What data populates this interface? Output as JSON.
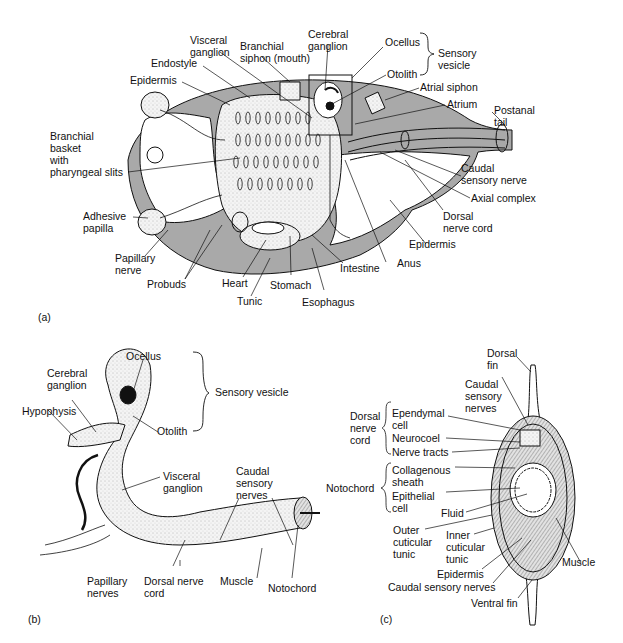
{
  "figure": {
    "panels": [
      {
        "id": "a",
        "tag": "(a)",
        "labels": {
          "visceral_ganglion": "Visceral\nganglion",
          "branchial_siphon": "Branchial\nsiphon (mouth)",
          "cerebral_ganglion": "Cerebral\nganglion",
          "ocellus": "Ocellus",
          "sensory_vesicle": "Sensory\nvesicle",
          "otolith": "Otolith",
          "endostyle": "Endostyle",
          "epidermis_top": "Epidermis",
          "atrial_siphon": "Atrial siphon",
          "atrium": "Atrium",
          "postanal_tail": "Postanal\ntail",
          "branchial_basket": "Branchial\nbasket\nwith\npharyngeal slits",
          "caudal_sensory_nerve": "Caudal\nsensory nerve",
          "axial_complex": "Axial complex",
          "dorsal_nerve_cord": "Dorsal\nnerve cord",
          "adhesive_papilla": "Adhesive\npapilla",
          "epidermis_bottom": "Epidermis",
          "papillary_nerve": "Papillary\nnerve",
          "anus": "Anus",
          "intestine": "Intestine",
          "probuds": "Probuds",
          "heart": "Heart",
          "stomach": "Stomach",
          "tunic": "Tunic",
          "esophagus": "Esophagus"
        }
      },
      {
        "id": "b",
        "tag": "(b)",
        "labels": {
          "ocellus": "Ocellus",
          "cerebral_ganglion": "Cerebral\nganglion",
          "sensory_vesicle": "Sensory vesicle",
          "hypophysis": "Hypophysis",
          "otolith": "Otolith",
          "visceral_ganglion": "Visceral\nganglion",
          "caudal_sensory_nerves": "Caudal\nsensory\nnerves",
          "papillary_nerves": "Papillary\nnerves",
          "dorsal_nerve_cord": "Dorsal nerve\ncord",
          "muscle": "Muscle",
          "notochord": "Notochord"
        }
      },
      {
        "id": "c",
        "tag": "(c)",
        "labels": {
          "dorsal_fin": "Dorsal\nfin",
          "caudal_sensory_nerves_top": "Caudal\nsensory\nnerves",
          "dorsal_nerve_cord": "Dorsal\nnerve\ncord",
          "ependymal_cell": "Ependymal\ncell",
          "neurocoel": "Neurocoel",
          "nerve_tracts": "Nerve tracts",
          "notochord": "Notochord",
          "collagenous_sheath": "Collagenous\nsheath",
          "epithelial_cell": "Epithelial\ncell",
          "fluid": "Fluid",
          "outer_cuticular_tunic": "Outer\ncuticular\ntunic",
          "inner_cuticular_tunic": "Inner\ncuticular\ntunic",
          "muscle": "Muscle",
          "epidermis": "Epidermis",
          "caudal_sensory_nerves_bottom": "Caudal sensory nerves",
          "ventral_fin": "Ventral fin"
        }
      }
    ],
    "colors": {
      "tunic_fill": "#a9a9a9",
      "body_fill": "#f2f2f2",
      "line": "#111111",
      "background": "#ffffff"
    }
  }
}
